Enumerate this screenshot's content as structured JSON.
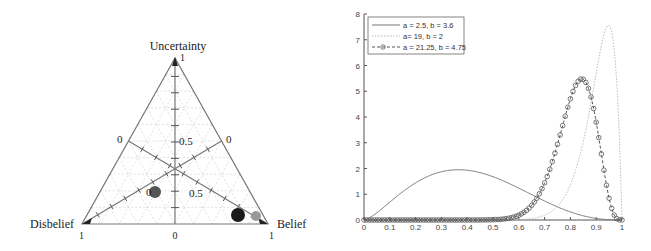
{
  "chart_data": [
    {
      "type": "scatter",
      "subtype": "ternary-opinion-triangle",
      "title": "",
      "vertices": {
        "top": {
          "label": "Uncertainty",
          "value_label": "1"
        },
        "left": {
          "label": "Disbelief",
          "value_label": "1"
        },
        "right": {
          "label": "Belief",
          "value_label": "1"
        }
      },
      "axis_labels": {
        "bottom_center_zero": "0",
        "left_edge_zero": "0",
        "right_edge_zero": "0",
        "uncertainty_half": "0.5",
        "belief_half": "0.5",
        "disbelief_half": "0.5"
      },
      "grid": true,
      "points": [
        {
          "name": "opinion-1",
          "belief": 0.1,
          "disbelief": 0.55,
          "uncertainty": 0.35,
          "color": "#555555",
          "size": "medium"
        },
        {
          "name": "opinion-2",
          "belief": 0.78,
          "disbelief": 0.1,
          "uncertainty": 0.12,
          "color": "#1a1a1a",
          "size": "large"
        },
        {
          "name": "opinion-3",
          "belief": 0.87,
          "disbelief": 0.05,
          "uncertainty": 0.08,
          "color": "#999999",
          "size": "small"
        }
      ]
    },
    {
      "type": "line",
      "title": "",
      "xlabel": "",
      "ylabel": "",
      "xlim": [
        0,
        1
      ],
      "ylim": [
        0,
        8
      ],
      "x_ticks": [
        "0",
        "0.1",
        "0.2",
        "0.3",
        "0.4",
        "0.5",
        "0.6",
        "0.7",
        "0.8",
        "0.9",
        "1"
      ],
      "y_ticks": [
        "0",
        "1",
        "2",
        "3",
        "4",
        "5",
        "6",
        "7",
        "8"
      ],
      "grid": false,
      "legend_position": "upper left",
      "series": [
        {
          "name": "a = 2.5, b = 3.6",
          "a": 2.5,
          "b": 3.6,
          "style": "solid",
          "color": "#777777",
          "marker": "none",
          "peak_x": 0.37,
          "peak_y": 1.93
        },
        {
          "name": "a= 19, b = 2",
          "a": 19,
          "b": 2,
          "style": "dotted",
          "color": "#bbbbbb",
          "marker": "none",
          "peak_x": 0.95,
          "peak_y": 7.5
        },
        {
          "name": "a = 21.25, b = 4.75",
          "a": 21.25,
          "b": 4.75,
          "style": "dashed",
          "color": "#555555",
          "marker": "circle",
          "peak_x": 0.84,
          "peak_y": 5.45
        }
      ]
    }
  ],
  "left_chart": {
    "top_label": "Uncertainty",
    "top_value": "1",
    "left_label": "Disbelief",
    "left_value": "1",
    "right_label": "Belief",
    "right_value": "1",
    "bottom_zero": "0",
    "left_zero": "0",
    "right_zero": "0",
    "u_half": "0.5",
    "b_half": "0.5",
    "d_half": "0"
  },
  "right_chart": {
    "legend": [
      {
        "label": "a = 2.5, b = 3.6"
      },
      {
        "label": "a= 19, b = 2"
      },
      {
        "label": "a = 21.25, b = 4.75"
      }
    ],
    "x_ticks": [
      "0",
      "0.1",
      "0.2",
      "0.3",
      "0.4",
      "0.5",
      "0.6",
      "0.7",
      "0.8",
      "0.9",
      "1"
    ],
    "y_ticks": [
      "0",
      "1",
      "2",
      "3",
      "4",
      "5",
      "6",
      "7",
      "8"
    ]
  }
}
